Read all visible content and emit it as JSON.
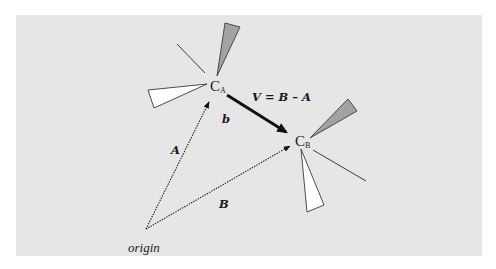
{
  "diagram": {
    "background_color": "#e6e6e6",
    "colors": {
      "gray_wedge": "#a3a3a3",
      "white_wedge": "#ffffff",
      "stroke": "#1a1a1a"
    },
    "points": {
      "origin": {
        "label": "origin"
      },
      "ca": {
        "label": "C",
        "subscript": "A"
      },
      "cb": {
        "label": "C",
        "subscript": "B"
      }
    },
    "vectors": {
      "a": {
        "label": "A",
        "style": "dotted"
      },
      "b_pos": {
        "label": "B",
        "style": "dotted"
      },
      "v": {
        "label": "V = B – A",
        "style": "thick"
      },
      "b_small": {
        "label": "b"
      }
    }
  }
}
